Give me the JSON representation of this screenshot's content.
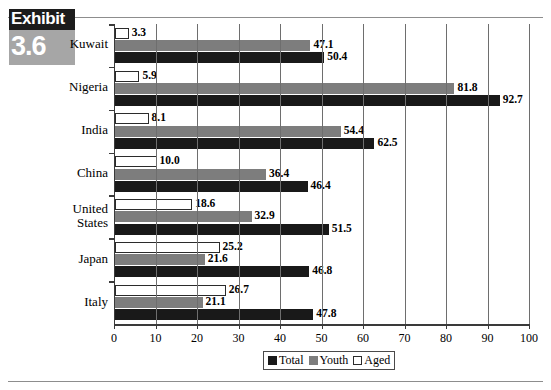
{
  "exhibit": {
    "word": "Exhibit",
    "number": "3.6"
  },
  "legend": {
    "items": [
      {
        "label": "Total",
        "color": "#191919"
      },
      {
        "label": "Youth",
        "color": "#7d7d7d"
      },
      {
        "label": "Aged",
        "color": "#ffffff"
      }
    ]
  },
  "chart_data": {
    "type": "bar",
    "orientation": "horizontal",
    "title": "",
    "xlabel": "",
    "ylabel": "",
    "xlim": [
      0,
      100
    ],
    "xticks": [
      0,
      10,
      20,
      30,
      40,
      50,
      60,
      70,
      80,
      90,
      100
    ],
    "xticklabels": [
      "0",
      "10",
      "20",
      "30",
      "40",
      "50",
      "60",
      "70",
      "80",
      "90",
      "100"
    ],
    "grid": true,
    "legend_position": "bottom-right",
    "categories": [
      "Kuwait",
      "Nigeria",
      "India",
      "China",
      "United States",
      "Japan",
      "Italy"
    ],
    "series": [
      {
        "name": "Total",
        "color": "#191919",
        "values": [
          50.4,
          92.7,
          62.5,
          46.4,
          51.5,
          46.8,
          47.8
        ]
      },
      {
        "name": "Youth",
        "color": "#7d7d7d",
        "values": [
          47.1,
          81.8,
          54.4,
          36.4,
          32.9,
          21.6,
          21.1
        ]
      },
      {
        "name": "Aged",
        "color": "#ffffff",
        "values": [
          3.3,
          5.9,
          8.1,
          10.0,
          18.6,
          25.2,
          26.7
        ]
      }
    ],
    "datalabels": {
      "Kuwait": {
        "Aged": "3.3",
        "Youth": "47.1",
        "Total": "50.4"
      },
      "Nigeria": {
        "Aged": "5.9",
        "Youth": "81.8",
        "Total": "92.7"
      },
      "India": {
        "Aged": "8.1",
        "Youth": "54.4",
        "Total": "62.5"
      },
      "China": {
        "Aged": "10.0",
        "Youth": "36.4",
        "Total": "46.4"
      },
      "United States": {
        "Aged": "18.6",
        "Youth": "32.9",
        "Total": "51.5"
      },
      "Japan": {
        "Aged": "25.2",
        "Youth": "21.6",
        "Total": "46.8"
      },
      "Italy": {
        "Aged": "26.7",
        "Youth": "21.1",
        "Total": "47.8"
      }
    }
  }
}
